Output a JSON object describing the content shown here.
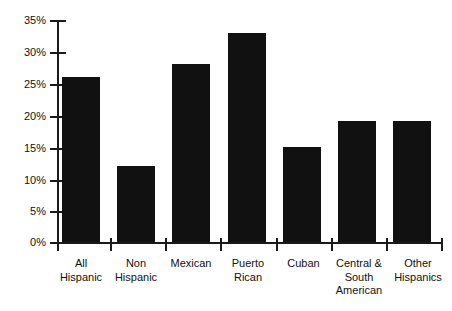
{
  "chart_data": {
    "type": "bar",
    "title": "",
    "subtitle": "",
    "xlabel": "",
    "ylabel": "",
    "categories": [
      "All Hispanic",
      "Non Hispanic",
      "Mexican",
      "Puerto Rican",
      "Cuban",
      "Central & South American",
      "Other Hispanics"
    ],
    "category_lines": [
      [
        "All",
        "Hispanic"
      ],
      [
        "Non",
        "Hispanic"
      ],
      [
        "Mexican"
      ],
      [
        "Puerto",
        "Rican"
      ],
      [
        "Cuban"
      ],
      [
        "Central &",
        "South",
        "American"
      ],
      [
        "Other",
        "Hispanics"
      ]
    ],
    "values": [
      26,
      12,
      28,
      33,
      15,
      19,
      19
    ],
    "ylim": [
      0,
      35
    ],
    "ytick_values": [
      0,
      5,
      10,
      15,
      20,
      25,
      30,
      35
    ],
    "ytick_labels": [
      "0%",
      "5%",
      "10%",
      "15%",
      "20%",
      "25%",
      "30%",
      "35%"
    ],
    "grid": false,
    "legend": null,
    "legend_position": "none",
    "bar_color": "#111111",
    "axis_color": "#1a1a1a",
    "background_color": "#ffffff"
  }
}
